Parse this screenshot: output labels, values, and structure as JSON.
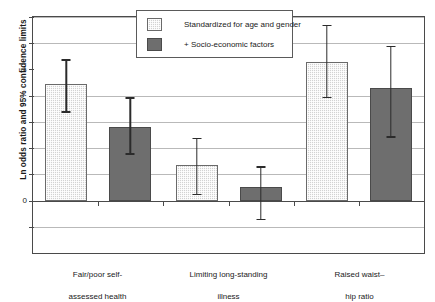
{
  "chart_data": {
    "type": "bar",
    "title": "",
    "xlabel": "",
    "ylabel": "Ln odds ratio and 95% confidence limits",
    "ylim": [
      -0.4,
      1.4
    ],
    "yticks": [
      0,
      1
    ],
    "ytick_labels": [
      "0",
      "1"
    ],
    "gridlines": [
      -0.2,
      0.2,
      0.4,
      0.6,
      0.8,
      1.2,
      1.4
    ],
    "grid": true,
    "legend_position": "top-center",
    "categories": [
      "Fair/poor self-\nassessed health",
      "Limiting long-standing\nillness",
      "Raised waist–\nhip ratio"
    ],
    "series": [
      {
        "name": "Standardized for age and gender",
        "color": "#d2d2d2",
        "values": [
          0.89,
          0.27,
          1.06
        ],
        "ci_low": [
          0.67,
          0.04,
          0.78
        ],
        "ci_high": [
          1.08,
          0.48,
          1.34
        ]
      },
      {
        "name": "+ Socio-economic factors",
        "color": "#6e6e6e",
        "values": [
          0.56,
          0.1,
          0.86
        ],
        "ci_low": [
          0.35,
          -0.15,
          0.48
        ],
        "ci_high": [
          0.79,
          0.26,
          1.18
        ]
      }
    ]
  },
  "legend": {
    "items": [
      {
        "label": "Standardized for age and gender"
      },
      {
        "label": "+ Socio-economic factors"
      }
    ]
  },
  "axis": {
    "y_title": "Ln odds ratio and 95% confidence limits",
    "tick_0": "0",
    "tick_1": "1"
  },
  "categories": [
    {
      "line1": "Fair/poor self-",
      "line2": "assessed health"
    },
    {
      "line1": "Limiting long-standing",
      "line2": "illness"
    },
    {
      "line1": "Raised waist–",
      "line2": "hip ratio"
    }
  ]
}
